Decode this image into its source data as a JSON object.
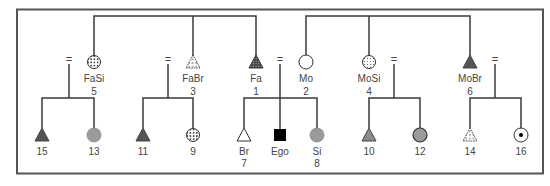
{
  "diagram": {
    "type": "kinship-chart",
    "colors": {
      "line": "#3a3a3a",
      "frame": "#555555",
      "dark_fill": "#555555",
      "gray_fill": "#9a9a9a",
      "black": "#000000",
      "white": "#ffffff"
    },
    "marriage_symbol": "=",
    "parent_generation": [
      {
        "id": "fasi",
        "label": "FaSi",
        "number": "5",
        "shape": "circle",
        "fill": "dotted",
        "x": 94
      },
      {
        "id": "fabr",
        "label": "FaBr",
        "number": "3",
        "shape": "triangle",
        "fill": "dotted-light",
        "x": 193
      },
      {
        "id": "fa",
        "label": "Fa",
        "number": "1",
        "shape": "triangle",
        "fill": "dotted-dark",
        "x": 256
      },
      {
        "id": "mo",
        "label": "Mo",
        "number": "2",
        "shape": "circle",
        "fill": "empty",
        "x": 306
      },
      {
        "id": "mosi",
        "label": "MoSi",
        "number": "4",
        "shape": "circle",
        "fill": "grid",
        "x": 369
      },
      {
        "id": "mobr",
        "label": "MoBr",
        "number": "6",
        "shape": "triangle",
        "fill": "dark",
        "x": 470
      }
    ],
    "child_generation": [
      {
        "id": "c15",
        "label": "",
        "number": "15",
        "shape": "triangle",
        "fill": "dark",
        "x": 42
      },
      {
        "id": "c13",
        "label": "",
        "number": "13",
        "shape": "circle",
        "fill": "gray",
        "x": 94
      },
      {
        "id": "c11",
        "label": "",
        "number": "11",
        "shape": "triangle",
        "fill": "dark",
        "x": 143
      },
      {
        "id": "c9",
        "label": "",
        "number": "9",
        "shape": "circle",
        "fill": "dotted",
        "x": 193
      },
      {
        "id": "br",
        "label": "Br",
        "number": "7",
        "shape": "triangle",
        "fill": "empty",
        "x": 244
      },
      {
        "id": "ego",
        "label": "Ego",
        "number": "",
        "shape": "square",
        "fill": "black",
        "x": 280
      },
      {
        "id": "si",
        "label": "Si",
        "number": "8",
        "shape": "circle",
        "fill": "gray",
        "x": 317
      },
      {
        "id": "c10",
        "label": "",
        "number": "10",
        "shape": "triangle",
        "fill": "gray",
        "x": 369
      },
      {
        "id": "c12",
        "label": "",
        "number": "12",
        "shape": "circle",
        "fill": "gray-outlined",
        "x": 420
      },
      {
        "id": "c14",
        "label": "",
        "number": "14",
        "shape": "triangle",
        "fill": "dotted-light",
        "x": 470
      },
      {
        "id": "c16",
        "label": "",
        "number": "16",
        "shape": "circle",
        "fill": "dot-center",
        "x": 521
      }
    ]
  }
}
